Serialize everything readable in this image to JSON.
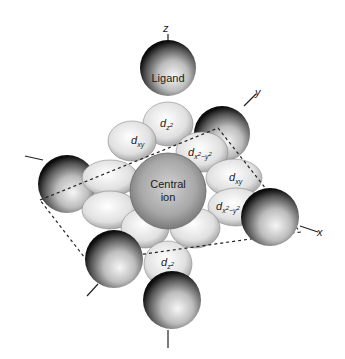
{
  "diagram": {
    "type": "octahedral-complex",
    "axes": {
      "z": "z",
      "y": "y",
      "x": "x"
    },
    "ligand_label": "Ligand",
    "central_label_line1": "Central",
    "central_label_line2": "ion",
    "orbitals": {
      "dz2_top": {
        "base": "d",
        "sub": "z",
        "sup": "2"
      },
      "dz2_bottom": {
        "base": "d",
        "sub": "z",
        "sup": "2"
      },
      "dxy_left": {
        "base": "d",
        "sub": "xy"
      },
      "dxy_right": {
        "base": "d",
        "sub": "xy"
      },
      "dx2y2_upper": {
        "base": "d",
        "sub": "x",
        "sup1": "2",
        "mid": "−y",
        "sup2": "2"
      },
      "dx2y2_right": {
        "base": "d",
        "sub": "x",
        "sup1": "2",
        "mid": "−y",
        "sup2": "2"
      }
    },
    "colors": {
      "sphere_edge": "#111111",
      "sphere_light": "#f4f4f4",
      "lobe": "#e6e6e6",
      "dash": "#222222"
    }
  }
}
